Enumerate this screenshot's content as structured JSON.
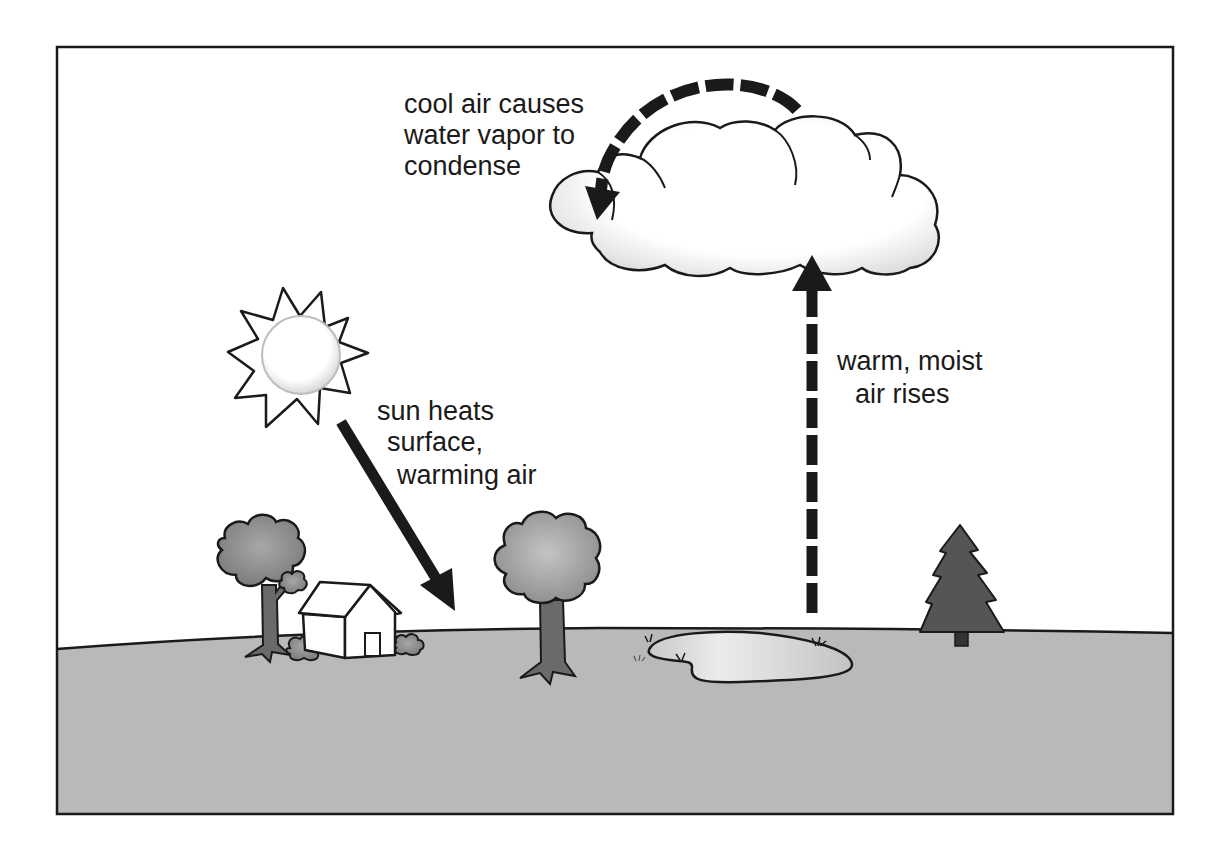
{
  "diagram": {
    "topic": "cloud formation by convection",
    "labels": {
      "condense": {
        "lines": [
          "cool air causes",
          "water vapor to",
          "condense"
        ]
      },
      "sun_heats": {
        "lines": [
          "sun heats",
          "surface,",
          "warming air"
        ]
      },
      "air_rises": {
        "lines": [
          "warm, moist",
          "air rises"
        ]
      }
    },
    "elements": [
      {
        "name": "sun",
        "icon": "sun-icon"
      },
      {
        "name": "cloud",
        "icon": "cloud-icon"
      },
      {
        "name": "house",
        "icon": "house-icon"
      },
      {
        "name": "deciduous tree (left)",
        "icon": "tree-icon"
      },
      {
        "name": "deciduous tree (middle)",
        "icon": "tree-icon"
      },
      {
        "name": "pine tree",
        "icon": "pine-tree-icon"
      },
      {
        "name": "pond",
        "icon": "pond-icon"
      },
      {
        "name": "bushes",
        "icon": "bush-icon"
      }
    ],
    "arrows": [
      {
        "from": "sun",
        "to": "ground",
        "style": "solid",
        "meaning": "sun heats surface"
      },
      {
        "from": "pond",
        "to": "cloud",
        "style": "dashed",
        "meaning": "warm, moist air rises"
      },
      {
        "from": "top of cloud",
        "to": "left of cloud",
        "style": "dashed-curved",
        "meaning": "cool air causes condensation"
      }
    ],
    "colors": {
      "ink": "#1a1a1a",
      "ground": "#b9b9b9",
      "sky": "#ffffff",
      "foliage": "#9a9a9a",
      "pine": "#555555",
      "trunk": "#6a6a6a",
      "pond": "#d6d6d6"
    }
  }
}
